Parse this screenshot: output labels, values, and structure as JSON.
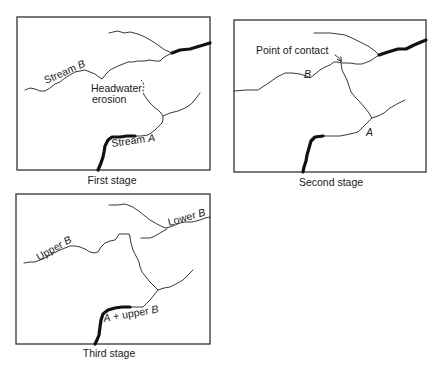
{
  "panels": [
    {
      "caption": "First stage",
      "labels": {
        "stream_b_prefix": "Stream ",
        "stream_b_letter": "B",
        "headwater_line1": "Headwater",
        "headwater_line2": "erosion",
        "stream_a_prefix": "Stream ",
        "stream_a_letter": "A"
      }
    },
    {
      "caption": "Second stage",
      "labels": {
        "point_of_contact": "Point of contact",
        "b_letter": "B",
        "a_letter": "A"
      }
    },
    {
      "caption": "Third stage",
      "labels": {
        "upper_prefix": "Upper ",
        "upper_letter": "B",
        "lower_prefix": "Lower ",
        "lower_letter": "B",
        "combined_a": "A",
        "combined_mid": " + upper ",
        "combined_b": "B"
      }
    }
  ]
}
